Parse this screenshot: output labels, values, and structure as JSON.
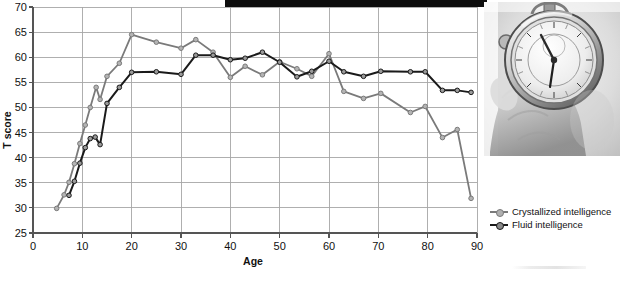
{
  "figure": {
    "banner": {
      "name": "top-black-bar"
    },
    "photo": {
      "alt": "hand-holding-stopwatch",
      "caption": ""
    }
  },
  "chart_data": {
    "type": "line",
    "title": "",
    "subtitle": "",
    "xlabel": "Age",
    "ylabel": "T score",
    "xlim": [
      0,
      90
    ],
    "ylim": [
      25,
      70
    ],
    "xticks": [
      0,
      10,
      20,
      30,
      40,
      50,
      60,
      70,
      80,
      90
    ],
    "yticks": [
      25,
      30,
      35,
      40,
      45,
      50,
      55,
      60,
      65,
      70
    ],
    "grid": true,
    "legend_position": "right",
    "markers": "circle",
    "series": [
      {
        "name": "Crystallized intelligence",
        "color": "#7a7a7a",
        "marker_fill": "#b4b4b4",
        "points": [
          [
            4.8,
            29.9
          ],
          [
            6.3,
            32.6
          ],
          [
            7.3,
            35.1
          ],
          [
            8.4,
            38.8
          ],
          [
            9.5,
            42.8
          ],
          [
            10.6,
            46.5
          ],
          [
            11.6,
            50.0
          ],
          [
            12.8,
            54.0
          ],
          [
            13.6,
            51.6
          ],
          [
            15.0,
            56.2
          ],
          [
            17.5,
            58.8
          ],
          [
            20.0,
            64.5
          ],
          [
            25.0,
            63.0
          ],
          [
            30.0,
            61.8
          ],
          [
            33.0,
            63.5
          ],
          [
            36.5,
            61.0
          ],
          [
            40.0,
            56.0
          ],
          [
            43.0,
            58.2
          ],
          [
            46.5,
            56.5
          ],
          [
            50.0,
            59.1
          ],
          [
            53.5,
            57.7
          ],
          [
            56.5,
            56.2
          ],
          [
            60.0,
            60.7
          ],
          [
            63.0,
            53.2
          ],
          [
            67.0,
            51.8
          ],
          [
            70.5,
            52.8
          ],
          [
            76.5,
            49.0
          ],
          [
            79.5,
            50.2
          ],
          [
            83.0,
            44.0
          ],
          [
            86.0,
            45.6
          ],
          [
            88.8,
            31.9
          ]
        ]
      },
      {
        "name": "Fluid intelligence",
        "color": "#1a1a1a",
        "marker_fill": "#9a9a9a",
        "points": [
          [
            7.3,
            32.5
          ],
          [
            8.4,
            35.3
          ],
          [
            9.5,
            38.9
          ],
          [
            10.6,
            42.0
          ],
          [
            11.6,
            43.8
          ],
          [
            12.6,
            44.1
          ],
          [
            13.6,
            42.6
          ],
          [
            15.0,
            50.8
          ],
          [
            17.5,
            54.0
          ],
          [
            20.0,
            57.0
          ],
          [
            25.0,
            57.1
          ],
          [
            30.0,
            56.6
          ],
          [
            33.0,
            60.4
          ],
          [
            36.5,
            60.4
          ],
          [
            40.0,
            59.5
          ],
          [
            43.0,
            59.8
          ],
          [
            46.5,
            61.0
          ],
          [
            50.0,
            59.0
          ],
          [
            53.5,
            56.1
          ],
          [
            56.5,
            57.2
          ],
          [
            60.0,
            59.2
          ],
          [
            63.0,
            57.1
          ],
          [
            67.0,
            56.2
          ],
          [
            70.5,
            57.2
          ],
          [
            76.5,
            57.1
          ],
          [
            79.5,
            57.1
          ],
          [
            83.0,
            53.4
          ],
          [
            86.0,
            53.4
          ],
          [
            88.8,
            53.0
          ]
        ]
      }
    ],
    "axis": {
      "line_color": "#555555",
      "grid_color": "#a6a6a6"
    }
  },
  "legend": {
    "items": [
      {
        "label": "Crystallized intelligence",
        "color": "#7a7a7a",
        "dot": "#b0b0b0"
      },
      {
        "label": "Fluid intelligence",
        "color": "#1a1a1a",
        "dot": "#8a8a8a"
      }
    ]
  }
}
